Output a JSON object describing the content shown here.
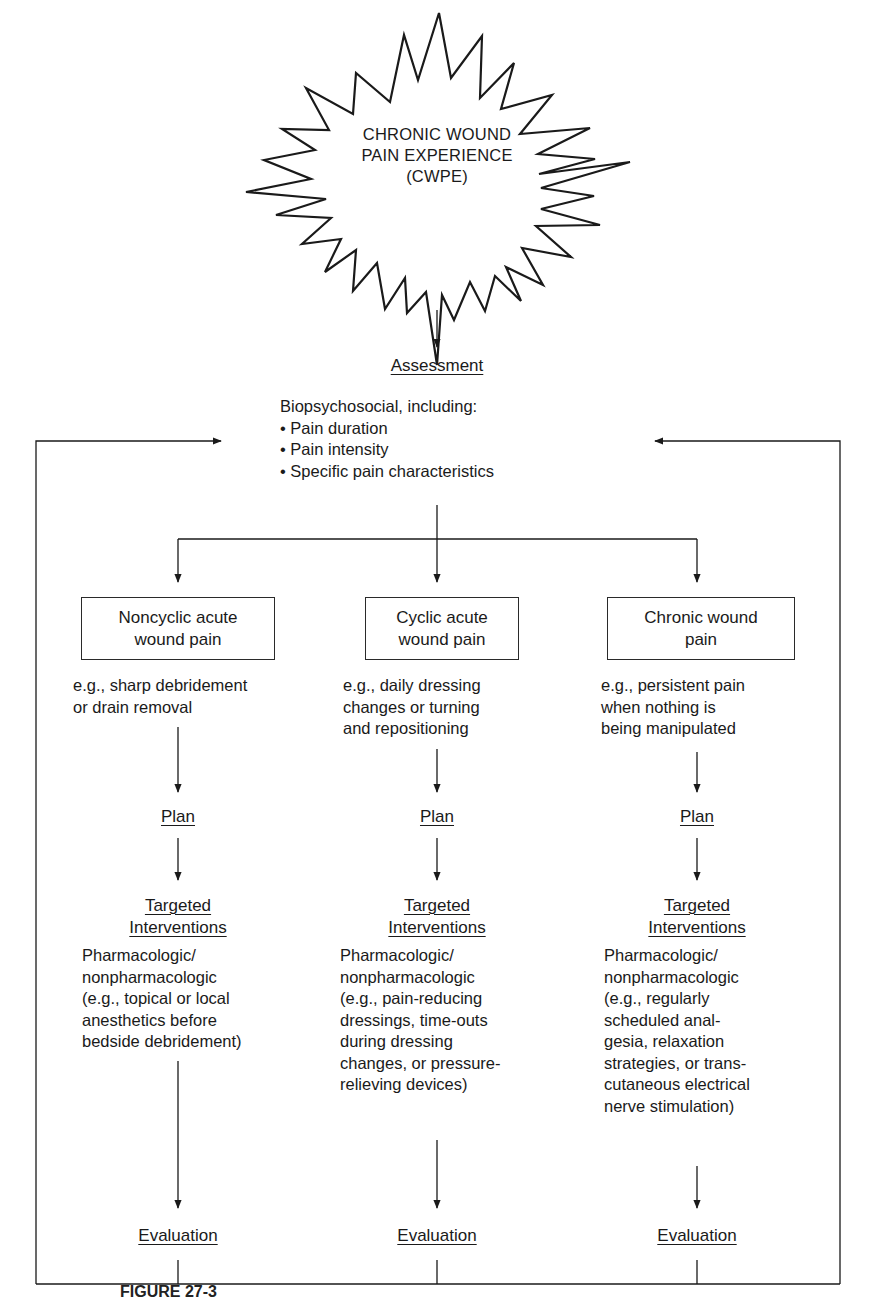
{
  "figure": {
    "central_node": {
      "line1": "CHRONIC WOUND",
      "line2": "PAIN EXPERIENCE",
      "line3": "(CWPE)",
      "shape": "starburst"
    },
    "assessment": {
      "heading": "Assessment",
      "intro": "Biopsychosocial, including:",
      "bullets": [
        "• Pain duration",
        "• Pain intensity",
        "• Specific pain characteristics"
      ]
    },
    "branches": [
      {
        "box_line1": "Noncyclic acute",
        "box_line2": "wound pain",
        "example": [
          "e.g., sharp debridement",
          "or drain removal"
        ],
        "plan": "Plan",
        "interventions_line1": "Targeted",
        "interventions_line2": "Interventions",
        "interventions_text": [
          "Pharmacologic/",
          "nonpharmacologic",
          "(e.g., topical or local",
          "anesthetics before",
          "bedside debridement)"
        ],
        "evaluation": "Evaluation"
      },
      {
        "box_line1": "Cyclic acute",
        "box_line2": "wound pain",
        "example": [
          "e.g., daily dressing",
          "changes or turning",
          "and repositioning"
        ],
        "plan": "Plan",
        "interventions_line1": "Targeted",
        "interventions_line2": "Interventions",
        "interventions_text": [
          "Pharmacologic/",
          "nonpharmacologic",
          "(e.g., pain-reducing",
          "dressings, time-outs",
          "during dressing",
          "changes, or pressure-",
          "relieving devices)"
        ],
        "evaluation": "Evaluation"
      },
      {
        "box_line1": "Chronic wound",
        "box_line2": "pain",
        "example": [
          "e.g., persistent pain",
          "when nothing is",
          "being manipulated"
        ],
        "plan": "Plan",
        "interventions_line1": "Targeted",
        "interventions_line2": "Interventions",
        "interventions_text": [
          "Pharmacologic/",
          "nonpharmacologic",
          "(e.g., regularly",
          "scheduled anal-",
          "gesia, relaxation",
          "strategies, or trans-",
          "cutaneous electrical",
          "nerve stimulation)"
        ],
        "evaluation": "Evaluation"
      }
    ],
    "caption": "FIGURE 27-3"
  }
}
